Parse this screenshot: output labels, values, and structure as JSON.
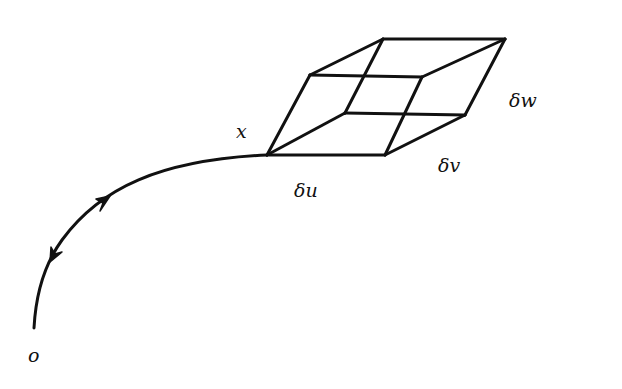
{
  "diagram": {
    "type": "curve-with-parallelepiped",
    "colors": {
      "stroke": "#111111",
      "background": "#ffffff"
    },
    "labels": {
      "origin": "o",
      "point": "x",
      "du": "δu",
      "dv": "δv",
      "dw": "δw"
    },
    "curve": {
      "from": "o",
      "to": "x",
      "arrows": [
        "toward x",
        "toward o"
      ]
    },
    "parallelepiped": {
      "vertices": {
        "A": [
          267,
          155
        ],
        "B": [
          385,
          155
        ],
        "C": [
          465,
          115
        ],
        "D": [
          345,
          113
        ],
        "E": [
          310,
          75
        ],
        "F": [
          422,
          77
        ],
        "G": [
          505,
          39
        ],
        "H": [
          383,
          39
        ]
      },
      "edges": [
        [
          "A",
          "B"
        ],
        [
          "A",
          "E"
        ],
        [
          "A",
          "D"
        ],
        [
          "B",
          "F"
        ],
        [
          "B",
          "C"
        ],
        [
          "E",
          "F"
        ],
        [
          "E",
          "H"
        ],
        [
          "D",
          "C"
        ],
        [
          "D",
          "H"
        ],
        [
          "F",
          "G"
        ],
        [
          "C",
          "G"
        ],
        [
          "H",
          "G"
        ]
      ]
    }
  }
}
